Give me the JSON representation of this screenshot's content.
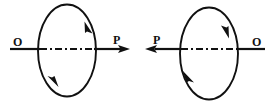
{
  "figure": {
    "width": 274,
    "height": 108,
    "background": "#ffffff",
    "stroke_color": "#111111",
    "panels": [
      {
        "id": "left",
        "axis_label_start": "O",
        "axis_label_end": "P",
        "axis_direction": "right",
        "loop_rotation": "counter-clockwise",
        "loop_arrow_top_right": "up",
        "loop_arrow_bottom_left": "down"
      },
      {
        "id": "right",
        "axis_label_start": "O",
        "axis_label_end": "P",
        "axis_direction": "left",
        "loop_rotation": "clockwise",
        "loop_arrow_top_right": "down",
        "loop_arrow_bottom_left": "up"
      }
    ]
  },
  "labels": {
    "left_O": "O",
    "left_P": "P",
    "right_P": "P",
    "right_O": "O"
  },
  "watermark": {
    "text": ""
  }
}
